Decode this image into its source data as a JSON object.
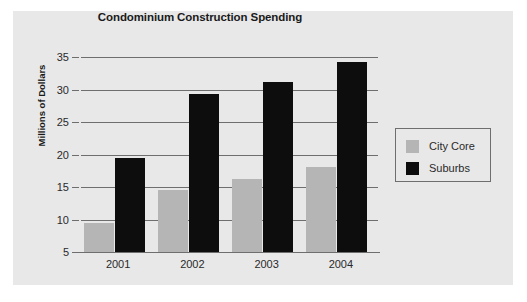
{
  "chart_data": {
    "type": "bar",
    "title": "Condominium Construction Spending",
    "xlabel": "",
    "ylabel": "Millions of Dollars",
    "categories": [
      "2001",
      "2002",
      "2003",
      "2004"
    ],
    "series": [
      {
        "name": "City Core",
        "color": "#b5b5b5",
        "values": [
          9.4,
          14.5,
          16.2,
          18.1
        ]
      },
      {
        "name": "Suburbs",
        "color": "#0d0d0d",
        "values": [
          19.4,
          29.3,
          31.2,
          34.3
        ]
      }
    ],
    "ylim": [
      5,
      35
    ],
    "yticks": [
      5,
      10,
      15,
      20,
      25,
      30,
      35
    ],
    "ytick_labels": [
      "5",
      "10",
      "15",
      "20",
      "25",
      "30",
      "35"
    ],
    "grid": true,
    "legend_position": "right",
    "legend_entries": [
      "City Core",
      "Suburbs"
    ],
    "panel_background": "#e8e8e8",
    "axis_color": "#6e6e6e"
  }
}
